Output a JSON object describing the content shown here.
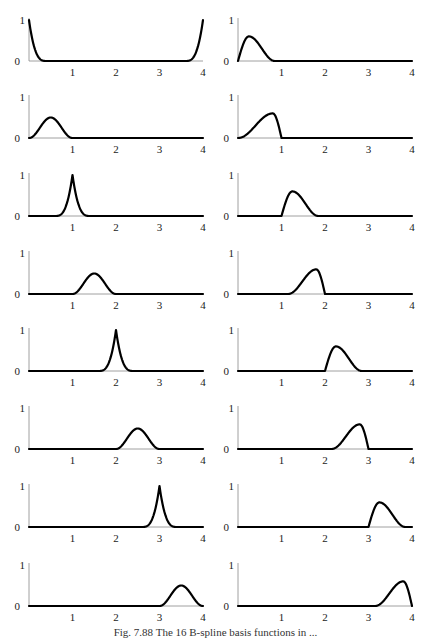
{
  "caption": "Fig. 7.88 The 16 B-spline basis functions in ...",
  "chart_data": {
    "type": "line",
    "title": "",
    "layout": {
      "rows": 8,
      "cols": 2,
      "order": "row-major"
    },
    "x_range": [
      0,
      4
    ],
    "y_range": [
      0,
      1
    ],
    "x_ticks": [
      "1",
      "2",
      "3",
      "4"
    ],
    "y_ticks": [
      "0",
      "1"
    ],
    "panels": [
      {
        "id": 1,
        "shape": "edge",
        "peak_x": [
          0,
          4
        ],
        "peak_y": 1.0,
        "support": [
          [
            0,
            0.4
          ],
          [
            3.6,
            4
          ]
        ]
      },
      {
        "id": 2,
        "shape": "skewR",
        "peak_x": 0.25,
        "peak_y": 0.6,
        "support": [
          0,
          0.85
        ]
      },
      {
        "id": 3,
        "shape": "bump",
        "peak_x": 0.5,
        "peak_y": 0.5,
        "support": [
          0,
          1
        ]
      },
      {
        "id": 4,
        "shape": "skewL",
        "peak_x": 0.8,
        "peak_y": 0.6,
        "support": [
          0,
          1
        ]
      },
      {
        "id": 5,
        "shape": "spike",
        "peak_x": 1.0,
        "peak_y": 1.0,
        "support": [
          0.6,
          1.4
        ]
      },
      {
        "id": 6,
        "shape": "skewR",
        "peak_x": 1.25,
        "peak_y": 0.6,
        "support": [
          1,
          1.85
        ]
      },
      {
        "id": 7,
        "shape": "bump",
        "peak_x": 1.5,
        "peak_y": 0.5,
        "support": [
          1,
          2
        ]
      },
      {
        "id": 8,
        "shape": "skewL",
        "peak_x": 1.8,
        "peak_y": 0.6,
        "support": [
          1.15,
          2
        ]
      },
      {
        "id": 9,
        "shape": "spike",
        "peak_x": 2.0,
        "peak_y": 1.0,
        "support": [
          1.6,
          2.4
        ]
      },
      {
        "id": 10,
        "shape": "skewR",
        "peak_x": 2.25,
        "peak_y": 0.6,
        "support": [
          2,
          2.85
        ]
      },
      {
        "id": 11,
        "shape": "bump",
        "peak_x": 2.5,
        "peak_y": 0.5,
        "support": [
          2,
          3
        ]
      },
      {
        "id": 12,
        "shape": "skewL",
        "peak_x": 2.8,
        "peak_y": 0.6,
        "support": [
          2.15,
          3
        ]
      },
      {
        "id": 13,
        "shape": "spike",
        "peak_x": 3.0,
        "peak_y": 1.0,
        "support": [
          2.6,
          3.4
        ]
      },
      {
        "id": 14,
        "shape": "skewR",
        "peak_x": 3.25,
        "peak_y": 0.6,
        "support": [
          3,
          3.85
        ]
      },
      {
        "id": 15,
        "shape": "bump",
        "peak_x": 3.5,
        "peak_y": 0.5,
        "support": [
          3,
          4
        ]
      },
      {
        "id": 16,
        "shape": "skewL",
        "peak_x": 3.8,
        "peak_y": 0.6,
        "support": [
          3.15,
          4
        ]
      }
    ],
    "xlabel": "",
    "ylabel": "",
    "grid": false,
    "legend": null
  }
}
